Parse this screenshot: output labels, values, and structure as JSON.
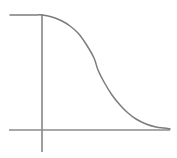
{
  "figure": {
    "title": "",
    "background_color": "#ffffff",
    "width": 177,
    "height": 158
  },
  "axes": {
    "line_color": "#8d8d8d",
    "line_width": 1.7,
    "vertical_axis": {
      "name": "y-axis",
      "x": 42,
      "y_top": 14,
      "y_bottom": 152,
      "has_arrowhead": false,
      "has_ticks": false,
      "label": ""
    },
    "horizontal_axis": {
      "name": "x-axis",
      "y": 130,
      "x_left": 9,
      "x_right": 170,
      "has_arrowhead": false,
      "has_ticks": false,
      "label": ""
    }
  },
  "chart_data": {
    "type": "line",
    "title": "",
    "subtitle": "",
    "xlabel": "",
    "ylabel": "",
    "grid": false,
    "legend": null,
    "legend_position": "none",
    "tick_labels_x": [],
    "tick_labels_y": [],
    "xlim": [
      0,
      180
    ],
    "ylim": [
      0,
      1
    ],
    "annotations": [],
    "series": [
      {
        "name": "sigmoid-decay",
        "shape": "decreasing-sigmoid",
        "color": "#7c7c7c",
        "line_width": 1.5,
        "x": [
          10,
          22,
          34,
          42,
          52,
          62,
          70,
          78,
          86,
          94,
          98,
          104,
          112,
          120,
          128,
          136,
          146,
          156,
          164,
          170
        ],
        "y": [
          15,
          15,
          15,
          15,
          17,
          21,
          26,
          33,
          44,
          58,
          70,
          82,
          95,
          105,
          113,
          119,
          124,
          127,
          128,
          129
        ],
        "value_start": 1.0,
        "value_end": 0.0,
        "inflection_x": 98,
        "inflection_y": 70
      }
    ]
  }
}
